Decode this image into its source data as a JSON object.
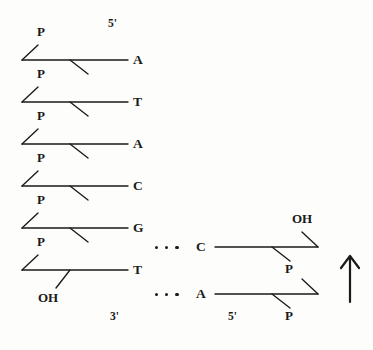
{
  "figure": {
    "type": "dna-strand-diagram",
    "background_color": "#fdfdfb",
    "ink_color": "#1a1a1a"
  },
  "left_strand": {
    "polarity_top_label": "5'",
    "polarity_bottom_label": "3'",
    "terminal_hydroxyl_label": "OH",
    "phosphate_label": "P",
    "phosphate_labels": [
      "P",
      "P",
      "P",
      "P",
      "P",
      "P"
    ],
    "bases": [
      {
        "letter": "A",
        "y": 60
      },
      {
        "letter": "T",
        "y": 102
      },
      {
        "letter": "A",
        "y": 144
      },
      {
        "letter": "C",
        "y": 186
      },
      {
        "letter": "G",
        "y": 228
      },
      {
        "letter": "T",
        "y": 270
      }
    ]
  },
  "right_strand": {
    "polarity_bottom_label": "5'",
    "terminal_hydroxyl_label": "OH",
    "phosphate_labels": [
      "P",
      "P"
    ],
    "bases": [
      {
        "letter": "C",
        "y": 247
      },
      {
        "letter": "A",
        "y": 294
      }
    ]
  },
  "base_pairs": [
    {
      "left": "G",
      "right": "C",
      "bond_dots": 3
    },
    {
      "left": "T",
      "right": "A",
      "bond_dots": 3
    }
  ],
  "direction_arrow": {
    "name": "up-arrow",
    "glyph": "↑",
    "meaning": "5' to 3' direction of new strand"
  }
}
